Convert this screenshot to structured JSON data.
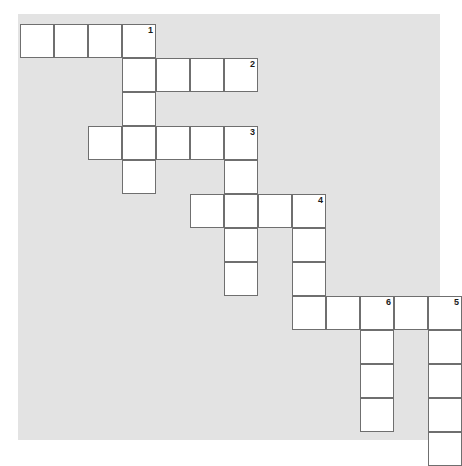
{
  "puzzle": {
    "kind": "crossword-grid",
    "title": "Crossword puzzle grid",
    "geometry": {
      "cell_size": 34,
      "origin_x": 20,
      "origin_y": 24,
      "columns": 13,
      "rows": 13
    },
    "colors": {
      "panel_background": "#e3e3e3",
      "page_background": "#ffffff",
      "cell_fill": "#ffffff",
      "cell_border": "#6f6f6f",
      "number_color": "#1a1a1a"
    },
    "panel": {
      "x": 18,
      "y": 14,
      "width": 422,
      "height": 426
    },
    "cells": [
      {
        "row": 0,
        "col": 0,
        "number": ""
      },
      {
        "row": 0,
        "col": 1,
        "number": ""
      },
      {
        "row": 0,
        "col": 2,
        "number": ""
      },
      {
        "row": 0,
        "col": 3,
        "number": "1"
      },
      {
        "row": 1,
        "col": 3,
        "number": ""
      },
      {
        "row": 1,
        "col": 4,
        "number": ""
      },
      {
        "row": 1,
        "col": 5,
        "number": ""
      },
      {
        "row": 1,
        "col": 6,
        "number": "2"
      },
      {
        "row": 2,
        "col": 3,
        "number": ""
      },
      {
        "row": 3,
        "col": 2,
        "number": ""
      },
      {
        "row": 3,
        "col": 3,
        "number": ""
      },
      {
        "row": 3,
        "col": 4,
        "number": ""
      },
      {
        "row": 3,
        "col": 5,
        "number": ""
      },
      {
        "row": 3,
        "col": 6,
        "number": "3"
      },
      {
        "row": 4,
        "col": 3,
        "number": ""
      },
      {
        "row": 4,
        "col": 6,
        "number": ""
      },
      {
        "row": 5,
        "col": 5,
        "number": ""
      },
      {
        "row": 5,
        "col": 6,
        "number": ""
      },
      {
        "row": 5,
        "col": 7,
        "number": ""
      },
      {
        "row": 5,
        "col": 8,
        "number": "4"
      },
      {
        "row": 6,
        "col": 6,
        "number": ""
      },
      {
        "row": 6,
        "col": 8,
        "number": ""
      },
      {
        "row": 7,
        "col": 6,
        "number": ""
      },
      {
        "row": 7,
        "col": 8,
        "number": ""
      },
      {
        "row": 8,
        "col": 8,
        "number": ""
      },
      {
        "row": 8,
        "col": 9,
        "number": ""
      },
      {
        "row": 8,
        "col": 10,
        "number": "6"
      },
      {
        "row": 8,
        "col": 11,
        "number": ""
      },
      {
        "row": 8,
        "col": 12,
        "number": "5"
      },
      {
        "row": 9,
        "col": 10,
        "number": ""
      },
      {
        "row": 9,
        "col": 12,
        "number": ""
      },
      {
        "row": 10,
        "col": 10,
        "number": ""
      },
      {
        "row": 10,
        "col": 12,
        "number": ""
      },
      {
        "row": 11,
        "col": 10,
        "number": ""
      },
      {
        "row": 11,
        "col": 12,
        "number": ""
      },
      {
        "row": 12,
        "col": 12,
        "number": ""
      }
    ],
    "clue_numbers": [
      "1",
      "2",
      "3",
      "4",
      "5",
      "6"
    ]
  }
}
